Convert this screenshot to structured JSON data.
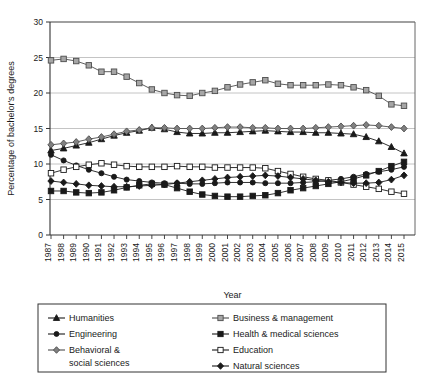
{
  "chart_data": {
    "type": "line",
    "title": "",
    "xlabel": "Year",
    "ylabel": "Percentage of bachelor's degrees",
    "ylim": [
      0,
      30
    ],
    "ytick_step": 5,
    "yticks": [
      0,
      5,
      10,
      15,
      20,
      25,
      30
    ],
    "grid": true,
    "grid_axis": "y",
    "legend_position": "bottom",
    "legend_columns": 2,
    "categories": [
      "1987",
      "1988",
      "1989",
      "1990",
      "1991",
      "1992",
      "1993",
      "1994",
      "1995",
      "1996",
      "1997",
      "1998",
      "1999",
      "2000",
      "2001",
      "2002",
      "2003",
      "2004",
      "2005",
      "2006",
      "2007",
      "2008",
      "2009",
      "2010",
      "2011",
      "2012",
      "2013",
      "2014",
      "2015"
    ],
    "series": [
      {
        "name": "Humanities",
        "marker": "triangle",
        "fill": "#1a1a1a",
        "stroke": "#1a1a1a",
        "values": [
          11.9,
          12.2,
          12.6,
          13.0,
          13.5,
          14.0,
          14.4,
          14.7,
          15.1,
          14.9,
          14.5,
          14.3,
          14.3,
          14.4,
          14.4,
          14.5,
          14.6,
          14.7,
          14.6,
          14.5,
          14.5,
          14.4,
          14.4,
          14.3,
          14.2,
          13.8,
          13.2,
          12.4,
          11.5
        ]
      },
      {
        "name": "Business & management",
        "marker": "square",
        "fill": "#a6a6a6",
        "stroke": "#4d4d4d",
        "values": [
          24.6,
          24.8,
          24.5,
          23.9,
          23.0,
          23.0,
          22.3,
          21.4,
          20.5,
          20.0,
          19.7,
          19.6,
          20.0,
          20.3,
          20.8,
          21.2,
          21.5,
          21.8,
          21.3,
          21.1,
          21.1,
          21.1,
          21.2,
          21.1,
          20.8,
          20.4,
          19.6,
          18.4,
          18.2
        ]
      },
      {
        "name": "Engineering",
        "marker": "circle",
        "fill": "#1a1a1a",
        "stroke": "#1a1a1a",
        "values": [
          11.3,
          10.5,
          9.8,
          9.2,
          8.7,
          8.2,
          7.8,
          7.6,
          7.4,
          7.3,
          7.3,
          7.2,
          7.2,
          7.3,
          7.4,
          7.4,
          7.4,
          7.3,
          7.3,
          7.3,
          7.4,
          7.5,
          7.7,
          7.9,
          8.2,
          8.6,
          8.9,
          9.2,
          9.6
        ]
      },
      {
        "name": "Health & medical sciences",
        "marker": "square",
        "fill": "#1a1a1a",
        "stroke": "#1a1a1a",
        "values": [
          6.2,
          6.2,
          6.0,
          5.9,
          6.0,
          6.3,
          6.7,
          7.0,
          7.2,
          7.1,
          6.6,
          6.1,
          5.7,
          5.5,
          5.4,
          5.4,
          5.5,
          5.6,
          5.9,
          6.3,
          6.6,
          6.9,
          7.2,
          7.5,
          7.9,
          8.4,
          9.0,
          9.7,
          10.3
        ]
      },
      {
        "name": "Behavioral & social sciences",
        "marker": "diamond",
        "fill": "#808080",
        "stroke": "#4d4d4d",
        "values": [
          12.7,
          12.9,
          13.1,
          13.5,
          13.8,
          14.2,
          14.6,
          14.8,
          15.1,
          15.1,
          15.0,
          15.0,
          15.0,
          15.1,
          15.2,
          15.2,
          15.1,
          15.1,
          15.0,
          15.0,
          15.0,
          15.1,
          15.2,
          15.3,
          15.4,
          15.5,
          15.4,
          15.2,
          15.0
        ]
      },
      {
        "name": "Education",
        "marker": "square-open",
        "fill": "#ffffff",
        "stroke": "#1a1a1a",
        "values": [
          8.7,
          9.2,
          9.6,
          9.9,
          10.1,
          9.9,
          9.7,
          9.6,
          9.6,
          9.6,
          9.7,
          9.6,
          9.6,
          9.5,
          9.5,
          9.5,
          9.5,
          9.4,
          9.0,
          8.6,
          8.2,
          7.9,
          7.7,
          7.4,
          7.1,
          6.8,
          6.5,
          6.1,
          5.8
        ]
      },
      {
        "name": "Natural sciences",
        "marker": "diamond",
        "fill": "#1a1a1a",
        "stroke": "#1a1a1a",
        "values": [
          7.6,
          7.4,
          7.2,
          7.0,
          6.9,
          6.8,
          6.8,
          6.9,
          7.0,
          7.1,
          7.3,
          7.5,
          7.7,
          7.9,
          8.1,
          8.2,
          8.3,
          8.4,
          8.3,
          8.1,
          7.9,
          7.7,
          7.5,
          7.4,
          7.3,
          7.3,
          7.4,
          7.8,
          8.4
        ]
      }
    ]
  },
  "legend": {
    "items": [
      {
        "label": "Humanities",
        "series": "Humanities"
      },
      {
        "label": "Business & management",
        "series": "Business & management"
      },
      {
        "label": "Engineering",
        "series": "Engineering"
      },
      {
        "label": "Health & medical sciences",
        "series": "Health & medical sciences"
      },
      {
        "label": "Behavioral & social sciences",
        "series": "Behavioral & social sciences"
      },
      {
        "label": "Education",
        "series": "Education"
      },
      {
        "label": "Natural sciences",
        "series": "Natural sciences"
      }
    ]
  }
}
